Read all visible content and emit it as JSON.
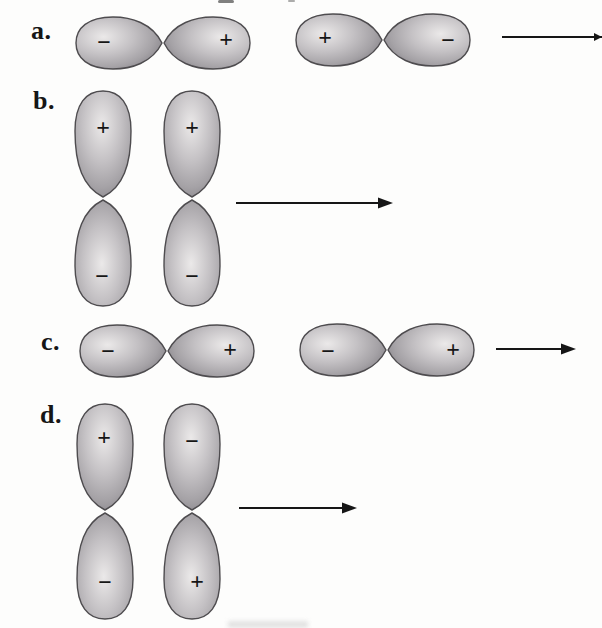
{
  "colors": {
    "background": "#fdfdfc",
    "lobe_highlight": "#ebe9e9",
    "lobe_mid": "#c4c1c4",
    "lobe_shadow": "#a5a2a6",
    "lobe_dark": "#8e8b90",
    "lobe_outline": "#4e4c4f",
    "ink": "#161616"
  },
  "diagram": {
    "rows": [
      {
        "label": "a.",
        "orbitals": [
          {
            "orientation": "horizontal",
            "signs": [
              "−",
              "+"
            ]
          },
          {
            "orientation": "horizontal",
            "signs": [
              "+",
              "−"
            ]
          }
        ],
        "arrow": {
          "direction": "right",
          "clipped_at_edge": true
        }
      },
      {
        "label": "b.",
        "orbitals": [
          {
            "orientation": "vertical",
            "signs": [
              "+",
              "−"
            ]
          },
          {
            "orientation": "vertical",
            "signs": [
              "+",
              "−"
            ]
          }
        ],
        "arrow": {
          "direction": "right",
          "clipped_at_edge": false
        }
      },
      {
        "label": "c.",
        "orbitals": [
          {
            "orientation": "horizontal",
            "signs": [
              "−",
              "+"
            ]
          },
          {
            "orientation": "horizontal",
            "signs": [
              "−",
              "+"
            ]
          }
        ],
        "arrow": {
          "direction": "right",
          "clipped_at_edge": false
        }
      },
      {
        "label": "d.",
        "orbitals": [
          {
            "orientation": "vertical",
            "signs": [
              "+",
              "−"
            ]
          },
          {
            "orientation": "vertical",
            "signs": [
              "−",
              "+"
            ]
          }
        ],
        "arrow": {
          "direction": "right",
          "clipped_at_edge": false
        }
      }
    ]
  }
}
